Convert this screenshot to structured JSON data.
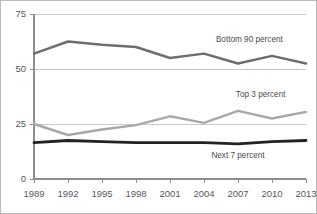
{
  "chart_data": {
    "type": "line",
    "title": "",
    "subtitle": "",
    "xlabel": "",
    "ylabel": "",
    "grid": true,
    "legend_position": "inline-annotations",
    "categories": [
      "1989",
      "1992",
      "1995",
      "1998",
      "2001",
      "2004",
      "2007",
      "2010",
      "2013"
    ],
    "x": [
      1989,
      1992,
      1995,
      1998,
      2001,
      2004,
      2007,
      2010,
      2013
    ],
    "xlim": [
      1989,
      2013
    ],
    "ylim": [
      0,
      75
    ],
    "yticks": [
      "0",
      "25",
      "50",
      "75"
    ],
    "ytick_values": [
      0,
      25,
      50,
      75
    ],
    "xticks": [
      "1989",
      "1992",
      "1995",
      "1998",
      "2001",
      "2004",
      "2007",
      "2010",
      "2013"
    ],
    "series": [
      {
        "name": "Bottom 90 percent",
        "label": "Bottom 90 percent",
        "color": "#6e6e70",
        "width": 2.4,
        "values": [
          57.0,
          62.5,
          61.0,
          60.0,
          55.0,
          57.0,
          52.5,
          56.0,
          52.5
        ],
        "label_x": 2008,
        "label_y": 62.5
      },
      {
        "name": "Top 3 percent",
        "label": "Top 3 percent",
        "color": "#a8a8aa",
        "width": 2.4,
        "values": [
          25.0,
          20.0,
          22.5,
          24.5,
          28.5,
          25.5,
          31.0,
          27.5,
          30.5
        ],
        "label_x": 2009,
        "label_y": 37.5
      },
      {
        "name": "Next 7 percent",
        "label": "Next 7 percent",
        "color": "#232323",
        "width": 2.8,
        "values": [
          16.5,
          17.5,
          17.0,
          16.5,
          16.5,
          16.5,
          16.0,
          17.0,
          17.5
        ],
        "label_x": 2007,
        "label_y": 9.5
      }
    ]
  },
  "axes": {
    "y_ticks": [
      {
        "label": "75",
        "value": 75
      },
      {
        "label": "50",
        "value": 50
      },
      {
        "label": "25",
        "value": 25
      },
      {
        "label": "0",
        "value": 0
      }
    ],
    "x_ticks": [
      {
        "label": "1989",
        "value": 1989
      },
      {
        "label": "1992",
        "value": 1992
      },
      {
        "label": "1995",
        "value": 1995
      },
      {
        "label": "1998",
        "value": 1998
      },
      {
        "label": "2001",
        "value": 2001
      },
      {
        "label": "2004",
        "value": 2004
      },
      {
        "label": "2007",
        "value": 2007
      },
      {
        "label": "2010",
        "value": 2010
      },
      {
        "label": "2013",
        "value": 2013
      }
    ]
  },
  "style": {
    "background": "#ffffff",
    "frame_color": "#b9b9b9",
    "axis_color": "#8d8d8f",
    "gridline_color": "#c9c9cb",
    "tick_text_color": "#58585a",
    "annotation_text_color": "#4a4a4c"
  },
  "geometry": {
    "plot_left": 33,
    "plot_right": 305,
    "plot_top": 13,
    "plot_bottom": 178
  }
}
